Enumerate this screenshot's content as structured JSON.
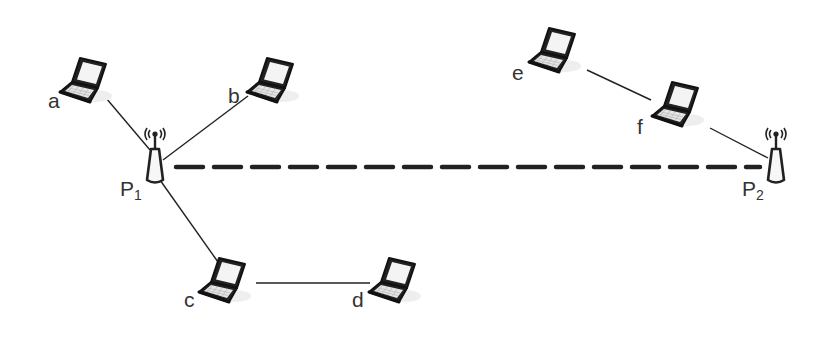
{
  "diagram": {
    "title": "",
    "access_points": [
      {
        "id": "P1",
        "label": "P",
        "subscript": "1",
        "x": 155,
        "y": 160
      },
      {
        "id": "P2",
        "label": "P",
        "subscript": "2",
        "x": 776,
        "y": 160
      }
    ],
    "devices": [
      {
        "id": "a",
        "label": "a",
        "type": "laptop",
        "x": 58,
        "y": 48
      },
      {
        "id": "b",
        "label": "b",
        "type": "laptop",
        "x": 245,
        "y": 48
      },
      {
        "id": "c",
        "label": "c",
        "type": "laptop",
        "x": 197,
        "y": 248
      },
      {
        "id": "d",
        "label": "d",
        "type": "laptop",
        "x": 367,
        "y": 248
      },
      {
        "id": "e",
        "label": "e",
        "type": "laptop",
        "x": 527,
        "y": 18
      },
      {
        "id": "f",
        "label": "f",
        "type": "laptop",
        "x": 650,
        "y": 72
      }
    ],
    "links": [
      {
        "from": "a",
        "to": "P1",
        "style": "solid"
      },
      {
        "from": "b",
        "to": "P1",
        "style": "solid"
      },
      {
        "from": "P1",
        "to": "c",
        "style": "solid"
      },
      {
        "from": "c",
        "to": "d",
        "style": "solid"
      },
      {
        "from": "e",
        "to": "f",
        "style": "solid"
      },
      {
        "from": "f",
        "to": "P2",
        "style": "solid"
      },
      {
        "from": "P1",
        "to": "P2",
        "style": "dashed-thick"
      }
    ],
    "colors": {
      "line": "#222222",
      "label": "#333333",
      "screen": "#f4f4f4",
      "background": "#ffffff"
    }
  }
}
